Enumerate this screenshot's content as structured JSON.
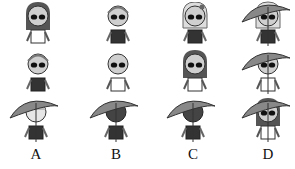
{
  "question": {
    "rows": 3,
    "columns": 4,
    "figures": [
      {
        "row": 1,
        "col": 1,
        "hair": "long",
        "shirt": "white",
        "hat": "none",
        "accessory": "sunglasses"
      },
      {
        "row": 1,
        "col": 2,
        "hair": "short",
        "shirt": "dark",
        "hat": "none",
        "accessory": "sunglasses"
      },
      {
        "row": 1,
        "col": 3,
        "hair": "long-light",
        "shirt": "dark",
        "hat": "none",
        "accessory": "sunglasses,bow"
      },
      {
        "row": 1,
        "col": 4,
        "hair": "long-light",
        "shirt": "dark",
        "hat": "umbrella-hat",
        "accessory": "sunglasses,bow"
      },
      {
        "row": 2,
        "col": 1,
        "hair": "short",
        "shirt": "dark",
        "hat": "none",
        "accessory": "sunglasses"
      },
      {
        "row": 2,
        "col": 2,
        "hair": "bald",
        "shirt": "white",
        "hat": "none",
        "accessory": "sunglasses"
      },
      {
        "row": 2,
        "col": 3,
        "hair": "long-dark",
        "shirt": "white",
        "hat": "none",
        "accessory": "sunglasses"
      },
      {
        "row": 2,
        "col": 4,
        "hair": "bald",
        "shirt": "white",
        "hat": "umbrella-hat",
        "accessory": "sunglasses"
      }
    ],
    "options": [
      {
        "label": "A",
        "hair": "light",
        "shirt": "dark",
        "hat": "umbrella-hat"
      },
      {
        "label": "B",
        "hair": "dark-curly",
        "shirt": "dark",
        "hat": "umbrella-hat"
      },
      {
        "label": "C",
        "hair": "dark-curly",
        "shirt": "dark",
        "hat": "umbrella-hat"
      },
      {
        "label": "D",
        "hair": "long-dark",
        "shirt": "white",
        "hat": "umbrella-hat",
        "accessory": "sunglasses"
      }
    ]
  }
}
